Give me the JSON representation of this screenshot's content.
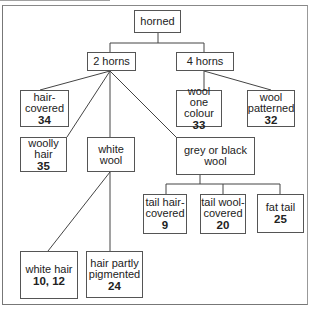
{
  "diagram": {
    "type": "classification tree",
    "nodes": [
      {
        "id": "horned",
        "label": "horned",
        "number": ""
      },
      {
        "id": "two-horns",
        "label": "2 horns",
        "number": ""
      },
      {
        "id": "four-horns",
        "label": "4 horns",
        "number": ""
      },
      {
        "id": "hair-covered",
        "label": "hair-\ncovered",
        "number": "34"
      },
      {
        "id": "woolly-hair",
        "label": "woolly\nhair",
        "number": "35"
      },
      {
        "id": "white-wool",
        "label": "white\nwool",
        "number": ""
      },
      {
        "id": "grey-black-wool",
        "label": "grey or black\nwool",
        "number": ""
      },
      {
        "id": "wool-one-colour",
        "label": "wool one\ncolour",
        "number": "33"
      },
      {
        "id": "wool-patterned",
        "label": "wool\npatterned",
        "number": "32"
      },
      {
        "id": "tail-hair-covered",
        "label": "tail hair-\ncovered",
        "number": "9"
      },
      {
        "id": "tail-wool-covered",
        "label": "tail wool-\ncovered",
        "number": "20"
      },
      {
        "id": "fat-tail",
        "label": "fat tail",
        "number": "25"
      },
      {
        "id": "white-hair",
        "label": "white hair",
        "number": "10, 12"
      },
      {
        "id": "hair-partly-pigmented",
        "label": "hair partly\npigmented",
        "number": "24"
      }
    ],
    "edges": [
      [
        "horned",
        "two-horns"
      ],
      [
        "horned",
        "four-horns"
      ],
      [
        "two-horns",
        "hair-covered"
      ],
      [
        "two-horns",
        "woolly-hair"
      ],
      [
        "two-horns",
        "white-wool"
      ],
      [
        "two-horns",
        "grey-black-wool"
      ],
      [
        "four-horns",
        "wool-one-colour"
      ],
      [
        "four-horns",
        "wool-patterned"
      ],
      [
        "grey-black-wool",
        "tail-hair-covered"
      ],
      [
        "grey-black-wool",
        "tail-wool-covered"
      ],
      [
        "grey-black-wool",
        "fat-tail"
      ],
      [
        "white-wool",
        "white-hair"
      ],
      [
        "white-wool",
        "hair-partly-pigmented"
      ]
    ]
  }
}
